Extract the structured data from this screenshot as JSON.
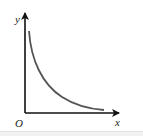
{
  "diagram": {
    "type": "function-graph",
    "axes": {
      "x_label": "x",
      "y_label": "y",
      "origin_label": "O"
    },
    "curve": {
      "shape": "decreasing-convex",
      "color": "#555555"
    },
    "colors": {
      "axis": "#111111",
      "curve": "#555555",
      "background": "#ffffff"
    }
  }
}
